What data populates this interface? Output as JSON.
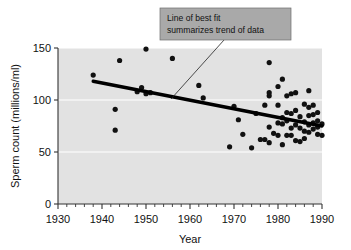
{
  "chart_data": {
    "type": "scatter",
    "title": "",
    "xlabel": "Year",
    "ylabel": "Sperm count (millions/ml)",
    "xlim": [
      1930,
      1990
    ],
    "ylim": [
      0,
      150
    ],
    "xticks": [
      1930,
      1940,
      1950,
      1960,
      1970,
      1980,
      1990
    ],
    "yticks": [
      0,
      50,
      100,
      150
    ],
    "minor_tick_interval": 2,
    "grid": "horizontal-white-gridlines",
    "legend": "none",
    "background_color": "#e2e2e2",
    "point_color": "#111111",
    "trendline_color": "#000000",
    "annotation_box_color": "#a9a9a9",
    "points": [
      {
        "x": 1938,
        "y": 124
      },
      {
        "x": 1943,
        "y": 91
      },
      {
        "x": 1943,
        "y": 71
      },
      {
        "x": 1944,
        "y": 138
      },
      {
        "x": 1948,
        "y": 108
      },
      {
        "x": 1949,
        "y": 112
      },
      {
        "x": 1950,
        "y": 149
      },
      {
        "x": 1950,
        "y": 106
      },
      {
        "x": 1951,
        "y": 107
      },
      {
        "x": 1956,
        "y": 140
      },
      {
        "x": 1962,
        "y": 114
      },
      {
        "x": 1963,
        "y": 102
      },
      {
        "x": 1969,
        "y": 55
      },
      {
        "x": 1970,
        "y": 94
      },
      {
        "x": 1971,
        "y": 81
      },
      {
        "x": 1972,
        "y": 67
      },
      {
        "x": 1974,
        "y": 54
      },
      {
        "x": 1975,
        "y": 87
      },
      {
        "x": 1976,
        "y": 62
      },
      {
        "x": 1977,
        "y": 95
      },
      {
        "x": 1977,
        "y": 62
      },
      {
        "x": 1978,
        "y": 136
      },
      {
        "x": 1978,
        "y": 104
      },
      {
        "x": 1978,
        "y": 107
      },
      {
        "x": 1978,
        "y": 74
      },
      {
        "x": 1978,
        "y": 59
      },
      {
        "x": 1979,
        "y": 68
      },
      {
        "x": 1980,
        "y": 113
      },
      {
        "x": 1980,
        "y": 95
      },
      {
        "x": 1980,
        "y": 78
      },
      {
        "x": 1980,
        "y": 66
      },
      {
        "x": 1981,
        "y": 120
      },
      {
        "x": 1981,
        "y": 83
      },
      {
        "x": 1981,
        "y": 77
      },
      {
        "x": 1981,
        "y": 57
      },
      {
        "x": 1982,
        "y": 104
      },
      {
        "x": 1982,
        "y": 88
      },
      {
        "x": 1982,
        "y": 80
      },
      {
        "x": 1982,
        "y": 66
      },
      {
        "x": 1983,
        "y": 106
      },
      {
        "x": 1983,
        "y": 87
      },
      {
        "x": 1983,
        "y": 73
      },
      {
        "x": 1983,
        "y": 66
      },
      {
        "x": 1984,
        "y": 107
      },
      {
        "x": 1984,
        "y": 90
      },
      {
        "x": 1984,
        "y": 76
      },
      {
        "x": 1984,
        "y": 61
      },
      {
        "x": 1985,
        "y": 84
      },
      {
        "x": 1985,
        "y": 73
      },
      {
        "x": 1985,
        "y": 60
      },
      {
        "x": 1986,
        "y": 96
      },
      {
        "x": 1986,
        "y": 79
      },
      {
        "x": 1986,
        "y": 70
      },
      {
        "x": 1986,
        "y": 63
      },
      {
        "x": 1987,
        "y": 109
      },
      {
        "x": 1987,
        "y": 93
      },
      {
        "x": 1987,
        "y": 85
      },
      {
        "x": 1987,
        "y": 76
      },
      {
        "x": 1987,
        "y": 69
      },
      {
        "x": 1988,
        "y": 95
      },
      {
        "x": 1988,
        "y": 86
      },
      {
        "x": 1988,
        "y": 78
      },
      {
        "x": 1988,
        "y": 72
      },
      {
        "x": 1989,
        "y": 88
      },
      {
        "x": 1989,
        "y": 80
      },
      {
        "x": 1989,
        "y": 74
      },
      {
        "x": 1989,
        "y": 67
      },
      {
        "x": 1990,
        "y": 77
      },
      {
        "x": 1990,
        "y": 66
      }
    ],
    "trendline": {
      "label": "Line of best fit",
      "x_start": 1938,
      "y_start": 118,
      "x_end": 1990,
      "y_end": 75
    }
  },
  "annotation": {
    "line1": "Line of best fit",
    "line2": "summarizes trend of data"
  }
}
